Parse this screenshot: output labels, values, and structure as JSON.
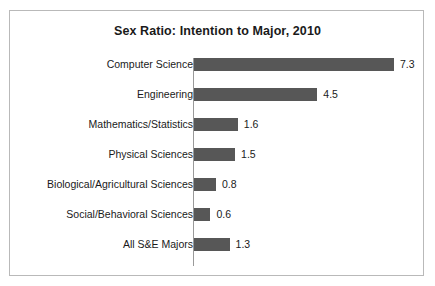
{
  "chart_data": {
    "type": "bar",
    "orientation": "horizontal",
    "title": "Sex Ratio: Intention to Major, 2010",
    "xlabel": "",
    "ylabel": "",
    "categories": [
      "Computer Science",
      "Engineering",
      "Mathematics/Statistics",
      "Physical Sciences",
      "Biological/Agricultural Sciences",
      "Social/Behavioral Sciences",
      "All S&E Majors"
    ],
    "values": [
      7.3,
      4.5,
      1.6,
      1.5,
      0.8,
      0.6,
      1.3
    ],
    "value_labels": [
      "7.3",
      "4.5",
      "1.6",
      "1.5",
      "0.8",
      "0.6",
      "1.3"
    ],
    "xlim": [
      0,
      7.3
    ],
    "grid": false,
    "legend": null,
    "bar_color": "#575757",
    "axis_color": "#9a9a9a",
    "frame_color": "#b9b9b9",
    "background": "#ffffff",
    "text_color": "#1a1a1a"
  }
}
